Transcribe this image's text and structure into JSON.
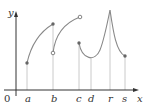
{
  "diagram": {
    "axes": {
      "x_label": "x",
      "y_label": "y",
      "origin_label": "0"
    },
    "tick_labels": [
      "a",
      "b",
      "c",
      "d",
      "r",
      "s"
    ],
    "points": [
      {
        "at": "a",
        "type": "filled"
      },
      {
        "at": "b",
        "type": "filled",
        "position": "end of first arc"
      },
      {
        "at": "b",
        "type": "open",
        "position": "start of second arc"
      },
      {
        "at": "c",
        "type": "open",
        "position": "end of second arc"
      },
      {
        "at": "c",
        "type": "filled",
        "position": "start of third piece"
      },
      {
        "at": "s",
        "type": "filled"
      }
    ],
    "features": {
      "d": "local minimum",
      "r": "cusp / local maximum"
    },
    "colors": {
      "curve": "#888888",
      "axis": "#333333",
      "guide": "#bbbbbb"
    }
  }
}
